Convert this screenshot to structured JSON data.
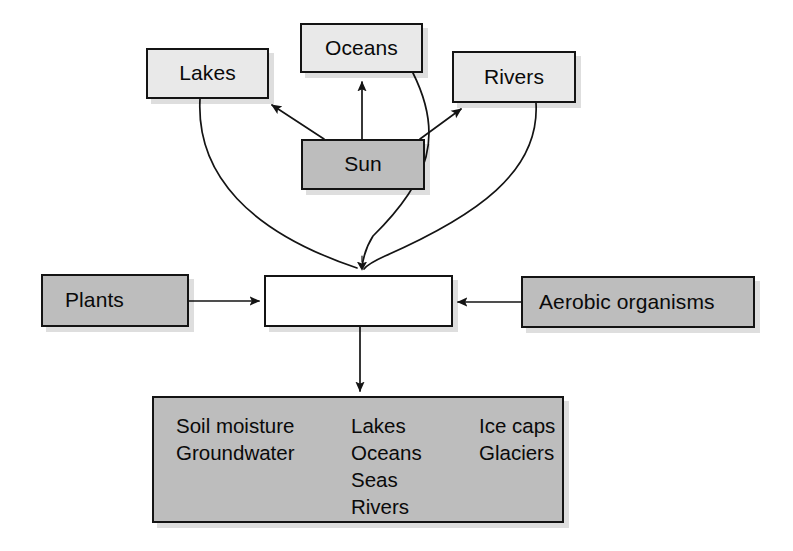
{
  "diagram": {
    "colors": {
      "box_light_fill": "#e9e9e9",
      "box_mid_fill": "#bdbdbd",
      "box_white_fill": "#ffffff",
      "border": "#141414",
      "text": "#0a0a0a",
      "background": "#ffffff",
      "shadow": "rgba(0,0,0,0.13)"
    },
    "nodes": {
      "oceans": {
        "label": "Oceans"
      },
      "lakes": {
        "label": "Lakes"
      },
      "rivers": {
        "label": "Rivers"
      },
      "sun": {
        "label": "Sun"
      },
      "plants": {
        "label": "Plants"
      },
      "reservoir": {
        "label": ""
      },
      "aerobic": {
        "label": "Aerobic organisms"
      }
    },
    "storage": {
      "columns": [
        {
          "items": [
            "Soil moisture",
            "Groundwater"
          ]
        },
        {
          "items": [
            "Lakes",
            "Oceans",
            "Seas",
            "Rivers"
          ]
        },
        {
          "items": [
            "Ice caps",
            "Glaciers"
          ]
        }
      ]
    },
    "edges": [
      {
        "name": "sun-to-lakes",
        "from": "sun",
        "to": "lakes",
        "style": "straight-arrow"
      },
      {
        "name": "sun-to-oceans",
        "from": "sun",
        "to": "oceans",
        "style": "straight-arrow"
      },
      {
        "name": "sun-to-rivers",
        "from": "sun",
        "to": "rivers",
        "style": "straight-arrow"
      },
      {
        "name": "lakes-to-reservoir",
        "from": "lakes",
        "to": "reservoir",
        "style": "curve"
      },
      {
        "name": "oceans-to-reservoir",
        "from": "oceans",
        "to": "reservoir",
        "style": "curve"
      },
      {
        "name": "rivers-to-reservoir",
        "from": "rivers",
        "to": "reservoir",
        "style": "curve"
      },
      {
        "name": "plants-to-reservoir",
        "from": "plants",
        "to": "reservoir",
        "style": "straight-arrow"
      },
      {
        "name": "aerobic-to-reservoir",
        "from": "aerobic",
        "to": "reservoir",
        "style": "straight-arrow"
      },
      {
        "name": "reservoir-to-storage",
        "from": "reservoir",
        "to": "storage",
        "style": "straight-arrow"
      }
    ]
  }
}
